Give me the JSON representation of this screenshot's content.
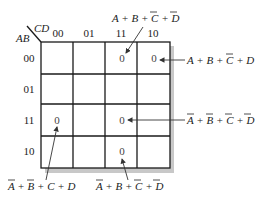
{
  "kmap": {
    "row_var": "AB",
    "col_var": "CD",
    "col_labels": [
      "00",
      "01",
      "11",
      "10"
    ],
    "row_labels": [
      "00",
      "01",
      "11",
      "10"
    ],
    "cells": [
      [
        "",
        "",
        "0",
        "0"
      ],
      [
        "",
        "",
        "",
        ""
      ],
      [
        "0",
        "",
        "0",
        ""
      ],
      [
        "",
        "",
        "0",
        ""
      ]
    ]
  },
  "annotations": [
    {
      "id": "top",
      "target": "row 00, col 11",
      "text_parts": [
        "A + B + ",
        "C",
        " + ",
        "D"
      ],
      "bars": [
        false,
        false,
        true,
        true
      ]
    },
    {
      "id": "right-top",
      "target": "row 00, col 10",
      "text_parts": [
        "A + B + ",
        "C",
        " + D"
      ]
    },
    {
      "id": "right-mid",
      "target": "row 11, col 11",
      "text_parts": [
        "A",
        " + ",
        "B",
        " + ",
        "C",
        " + ",
        "D"
      ]
    },
    {
      "id": "bottom-left",
      "target": "row 11, col 00",
      "text_parts": [
        "A",
        " + ",
        "B",
        " + C + D"
      ]
    },
    {
      "id": "bottom-mid",
      "target": "row 10, col 11",
      "text_parts": [
        "A",
        " + B + ",
        "C",
        " + ",
        "D"
      ]
    }
  ],
  "colors": {
    "grid": "#1a1a1a",
    "shadow": "#c8c8c8",
    "text": "#222222"
  }
}
